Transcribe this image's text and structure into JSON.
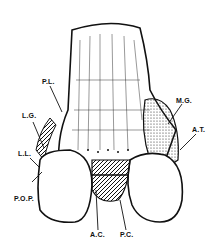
{
  "figure": {
    "labels": {
      "pl": "P.L.",
      "lg": "L.G.",
      "ll": "L.L.",
      "pop": "P.O.P.",
      "mg": "M.G.",
      "at": "A.T.",
      "ac": "A.C.",
      "pc": "P.C."
    }
  }
}
